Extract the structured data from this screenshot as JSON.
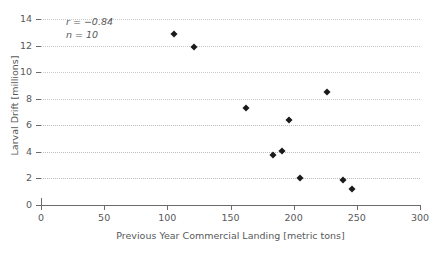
{
  "chart_data": {
    "type": "scatter",
    "title": "",
    "xlabel": "Previous Year Commercial Landing [metric tons]",
    "ylabel": "Larval Drift [millions]",
    "xlim": [
      0,
      300
    ],
    "ylim": [
      0,
      14
    ],
    "xticks": [
      0,
      50,
      100,
      150,
      200,
      250,
      300
    ],
    "yticks": [
      0,
      2,
      4,
      6,
      8,
      10,
      12,
      14
    ],
    "grid": true,
    "grid_axis": "y",
    "legend": "none",
    "marker_style": "diamond",
    "marker_color": "#1a1a1a",
    "points": [
      {
        "x": 105,
        "y": 12.85
      },
      {
        "x": 121,
        "y": 11.9
      },
      {
        "x": 162,
        "y": 7.3
      },
      {
        "x": 196,
        "y": 6.4
      },
      {
        "x": 191,
        "y": 4.1
      },
      {
        "x": 184,
        "y": 3.8
      },
      {
        "x": 226,
        "y": 8.5
      },
      {
        "x": 205,
        "y": 2.0
      },
      {
        "x": 239,
        "y": 1.9
      },
      {
        "x": 246,
        "y": 1.2
      }
    ],
    "annotations": {
      "correlation": "r = −0.84",
      "sample_size": "n = 10"
    }
  }
}
